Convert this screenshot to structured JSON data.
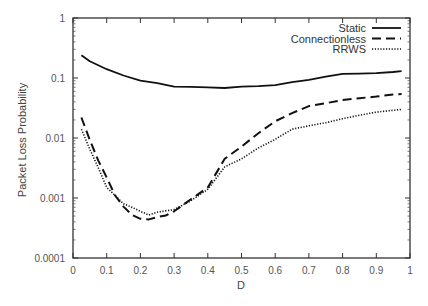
{
  "chart_data": {
    "type": "line",
    "title": "",
    "xlabel": "D",
    "ylabel": "Packet Loss Probability",
    "xlim": [
      0,
      1
    ],
    "ylim": [
      0.0001,
      1
    ],
    "yscale": "log",
    "grid": false,
    "legend_position": "top-right",
    "x_ticks": [
      "0",
      "0.1",
      "0.2",
      "0.3",
      "0.4",
      "0.5",
      "0.6",
      "0.7",
      "0.8",
      "0.9",
      "1"
    ],
    "y_ticks": [
      "1",
      "0.1",
      "0.01",
      "0.001",
      "0.0001"
    ],
    "series": [
      {
        "name": "Static",
        "style": "solid",
        "x": [
          0.025,
          0.05,
          0.1,
          0.15,
          0.2,
          0.25,
          0.3,
          0.35,
          0.4,
          0.45,
          0.5,
          0.55,
          0.6,
          0.65,
          0.7,
          0.75,
          0.8,
          0.85,
          0.9,
          0.95,
          0.975
        ],
        "values": [
          0.24,
          0.19,
          0.14,
          0.11,
          0.09,
          0.082,
          0.072,
          0.071,
          0.07,
          0.068,
          0.072,
          0.073,
          0.076,
          0.085,
          0.093,
          0.105,
          0.117,
          0.118,
          0.12,
          0.126,
          0.13
        ]
      },
      {
        "name": "Connectionless",
        "style": "dashed",
        "x": [
          0.025,
          0.05,
          0.075,
          0.1,
          0.125,
          0.15,
          0.175,
          0.2,
          0.225,
          0.25,
          0.275,
          0.3,
          0.35,
          0.4,
          0.45,
          0.5,
          0.55,
          0.6,
          0.65,
          0.7,
          0.75,
          0.8,
          0.85,
          0.9,
          0.95,
          0.975
        ],
        "values": [
          0.022,
          0.0093,
          0.0042,
          0.0022,
          0.0011,
          0.00072,
          0.00052,
          0.00045,
          0.00044,
          0.00048,
          0.00051,
          0.0006,
          0.00095,
          0.0015,
          0.0045,
          0.0072,
          0.012,
          0.019,
          0.026,
          0.034,
          0.038,
          0.043,
          0.046,
          0.049,
          0.053,
          0.054
        ]
      },
      {
        "name": "RRWS",
        "style": "dotted",
        "x": [
          0.025,
          0.05,
          0.075,
          0.1,
          0.125,
          0.15,
          0.175,
          0.2,
          0.225,
          0.25,
          0.275,
          0.3,
          0.35,
          0.4,
          0.45,
          0.5,
          0.55,
          0.6,
          0.65,
          0.7,
          0.75,
          0.8,
          0.85,
          0.9,
          0.95,
          0.975
        ],
        "values": [
          0.014,
          0.0065,
          0.0032,
          0.0015,
          0.0011,
          0.0008,
          0.0007,
          0.0006,
          0.00052,
          0.00058,
          0.00061,
          0.00064,
          0.0009,
          0.0014,
          0.0033,
          0.0045,
          0.0068,
          0.0095,
          0.014,
          0.016,
          0.018,
          0.021,
          0.024,
          0.027,
          0.029,
          0.03
        ]
      }
    ]
  },
  "legend": {
    "items": [
      "Static",
      "Connectionless",
      "RRWS"
    ]
  }
}
